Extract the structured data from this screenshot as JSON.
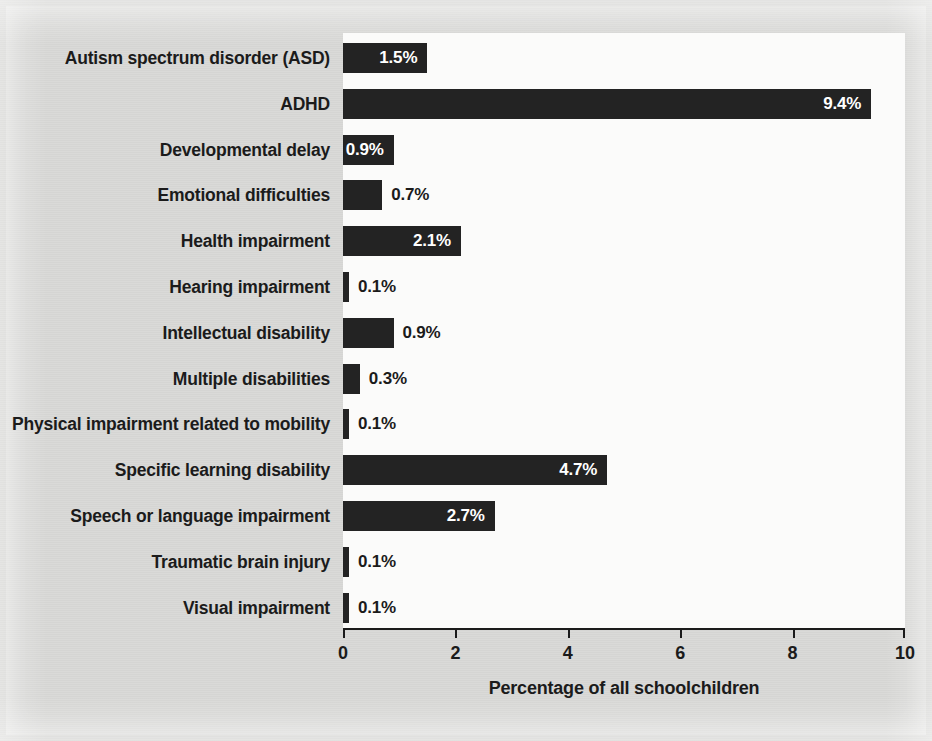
{
  "chart_data": {
    "type": "bar",
    "orientation": "horizontal",
    "title": "",
    "xlabel": "Percentage of all schoolchildren",
    "ylabel": "",
    "xlim": [
      0,
      10
    ],
    "xticks": [
      "0",
      "2",
      "4",
      "6",
      "8",
      "10"
    ],
    "grid": false,
    "legend": null,
    "bar_color": "#232323",
    "categories": [
      "Autism spectrum disorder (ASD)",
      "ADHD",
      "Developmental delay",
      "Emotional difficulties",
      "Health impairment",
      "Hearing impairment",
      "Intellectual disability",
      "Multiple disabilities",
      "Physical impairment related to mobility",
      "Specific learning disability",
      "Speech or language impairment",
      "Traumatic brain injury",
      "Visual impairment"
    ],
    "values": [
      1.5,
      9.4,
      0.9,
      0.7,
      2.1,
      0.1,
      0.9,
      0.3,
      0.1,
      4.7,
      2.7,
      0.1,
      0.1
    ],
    "data_labels": [
      "1.5%",
      "9.4%",
      "0.9%",
      "0.7%",
      "2.1%",
      "0.1%",
      "0.9%",
      "0.3%",
      "0.1%",
      "4.7%",
      "2.7%",
      "0.1%",
      "0.1%"
    ],
    "label_placement": [
      "inside",
      "inside",
      "inside",
      "outside",
      "inside",
      "outside",
      "outside",
      "outside",
      "outside",
      "inside",
      "inside",
      "outside",
      "outside"
    ]
  },
  "background": {
    "ghost_text": [
      "ing of children",
      "but it also can be a signpost",
      "so that by providing these growing bodies",
      "ple are deficient",
      "n bone",
      "lly less nutritious",
      "ones and a softer",
      "mation such as",
      "up to 30 percent, in order to",
      "ur child of up to three weeks to study in school",
      "the most of their play or becoming somewhat",
      "Unfortunately, many of these children may",
      "on vitamin"
    ]
  }
}
